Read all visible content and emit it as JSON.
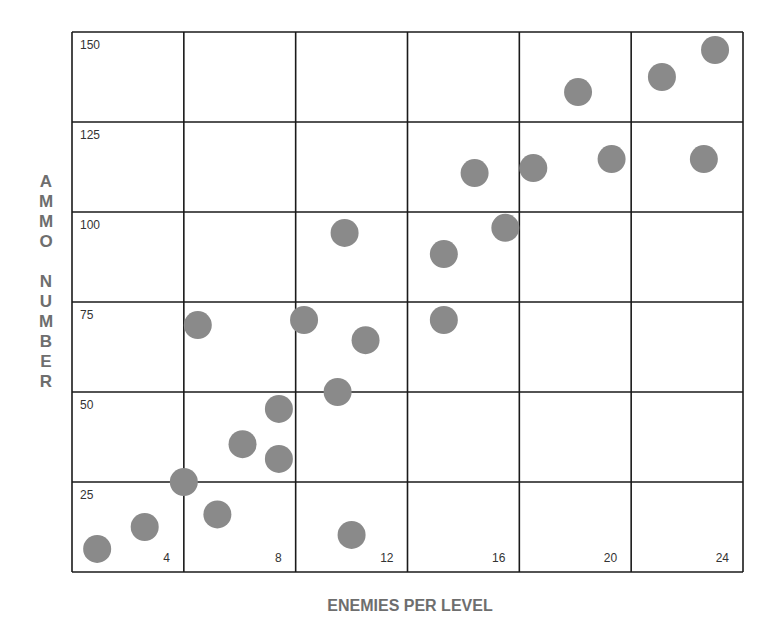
{
  "chart_data": {
    "type": "scatter",
    "title": "",
    "xlabel": "ENEMIES PER LEVEL",
    "ylabel": "AMMO NUMBER",
    "xlim": [
      0,
      24
    ],
    "ylim": [
      0,
      150
    ],
    "x_ticks": [
      4,
      8,
      12,
      16,
      20,
      24
    ],
    "y_ticks": [
      25,
      50,
      75,
      100,
      125,
      150
    ],
    "grid": true,
    "legend": null,
    "marker_color": "#8a8a8a",
    "series": [
      {
        "name": "points",
        "points": [
          {
            "x": 0.9,
            "y": 6.4
          },
          {
            "x": 2.6,
            "y": 12.5
          },
          {
            "x": 4.0,
            "y": 25.0
          },
          {
            "x": 5.2,
            "y": 16.0
          },
          {
            "x": 6.1,
            "y": 35.5
          },
          {
            "x": 7.4,
            "y": 31.4
          },
          {
            "x": 7.4,
            "y": 45.3
          },
          {
            "x": 4.5,
            "y": 68.6
          },
          {
            "x": 8.3,
            "y": 70.0
          },
          {
            "x": 10.5,
            "y": 64.4
          },
          {
            "x": 9.5,
            "y": 50.0
          },
          {
            "x": 10.0,
            "y": 10.3
          },
          {
            "x": 9.75,
            "y": 94.2
          },
          {
            "x": 13.3,
            "y": 70.0
          },
          {
            "x": 13.3,
            "y": 88.3
          },
          {
            "x": 15.5,
            "y": 95.6
          },
          {
            "x": 14.4,
            "y": 110.8
          },
          {
            "x": 16.5,
            "y": 112.2
          },
          {
            "x": 19.3,
            "y": 114.7
          },
          {
            "x": 22.6,
            "y": 114.7
          },
          {
            "x": 18.1,
            "y": 133.3
          },
          {
            "x": 21.1,
            "y": 137.5
          },
          {
            "x": 23.0,
            "y": 145.0
          }
        ]
      }
    ]
  },
  "labels": {
    "xlabel": "ENEMIES PER LEVEL",
    "ylabel_letters": [
      "A",
      "M",
      "M",
      "O",
      "",
      "N",
      "U",
      "M",
      "B",
      "E",
      "R"
    ]
  }
}
